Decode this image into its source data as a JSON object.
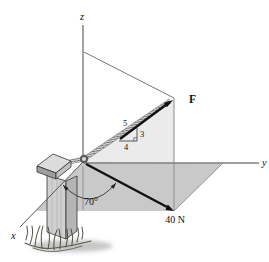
{
  "figure": {
    "type": "statics-force-diagram",
    "axis_labels": {
      "x": "x",
      "y": "y",
      "z": "z"
    },
    "force_label": "F",
    "force_magnitude_label": "40 N",
    "angle_label": "70°",
    "slope_triangle": {
      "hypotenuse": "5",
      "vertical": "3",
      "horizontal": "4"
    },
    "colors": {
      "plane_light": "#ebebeb",
      "plane_dark": "#c9c9c9",
      "arrow": "#111111",
      "axis_line": "#777777",
      "rope_base": "#d6d6d6",
      "post_face": "#d0d0d0",
      "post_side": "#b5b5b5",
      "cap_top": "#dcdcdc",
      "shadow": "#c6c6c6"
    }
  }
}
